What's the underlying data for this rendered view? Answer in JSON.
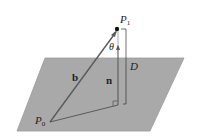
{
  "diagram": {
    "type": "geometry",
    "colors": {
      "plane_fill": "#a9a9a9",
      "plane_edge": "#9a9a9a",
      "vector": "#5a5a5a",
      "point": "#111111"
    },
    "labels": {
      "p1": "P",
      "p1_sub": "1",
      "p0": "P",
      "p0_sub": "0",
      "theta": "θ",
      "b": "b",
      "n": "n",
      "d": "D"
    }
  }
}
